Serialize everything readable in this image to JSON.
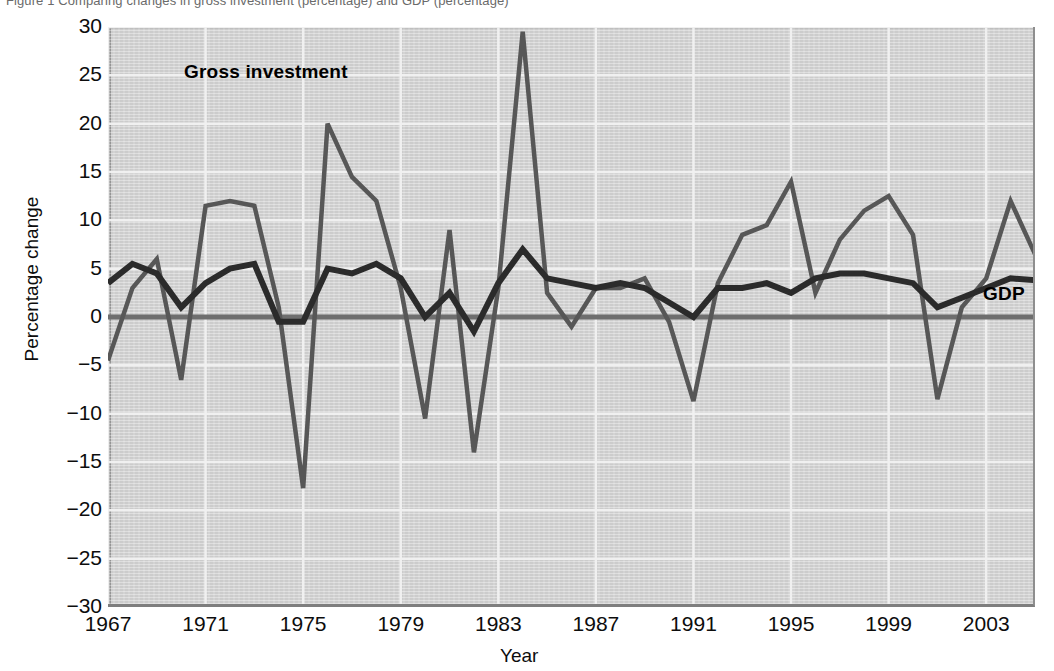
{
  "figure": {
    "caption": "Figure 1   Comparing changes in gross investment (percentage) and GDP (percentage)"
  },
  "annotations": {
    "investment_label": "Gross investment",
    "gdp_label": "GDP"
  },
  "colors": {
    "plot_background": "#d2d2d2",
    "gridline": "#f2f2f2",
    "investment_line": "#575757",
    "gdp_line": "#2b2b2b",
    "zero_line": "#6e6e6e",
    "text": "#0d0d0d"
  },
  "chart_data": {
    "type": "line",
    "title": "",
    "xlabel": "Year",
    "ylabel": "Percentage change",
    "xlim": [
      1967,
      2005
    ],
    "ylim": [
      -30,
      30
    ],
    "yticks": [
      30,
      25,
      20,
      15,
      10,
      5,
      0,
      -5,
      -10,
      -15,
      -20,
      -25,
      -30
    ],
    "ytick_labels": [
      "30",
      "25",
      "20",
      "15",
      "10",
      "5",
      "0",
      "−5",
      "−10",
      "−15",
      "−20",
      "−25",
      "−30"
    ],
    "xticks": [
      1967,
      1971,
      1975,
      1979,
      1983,
      1987,
      1991,
      1995,
      1999,
      2003
    ],
    "xtick_labels": [
      "1967",
      "1971",
      "1975",
      "1979",
      "1983",
      "1987",
      "1991",
      "1995",
      "1999",
      "2003"
    ],
    "grid": true,
    "legend": "in-plot annotations",
    "x": [
      1967,
      1968,
      1969,
      1970,
      1971,
      1972,
      1973,
      1974,
      1975,
      1976,
      1977,
      1978,
      1979,
      1980,
      1981,
      1982,
      1983,
      1984,
      1985,
      1986,
      1987,
      1988,
      1989,
      1990,
      1991,
      1992,
      1993,
      1994,
      1995,
      1996,
      1997,
      1998,
      1999,
      2000,
      2001,
      2002,
      2003,
      2004,
      2005
    ],
    "series": [
      {
        "name": "Gross investment",
        "color": "#575757",
        "values": [
          -4.5,
          3.0,
          6.0,
          -6.5,
          11.5,
          12.0,
          11.5,
          1.0,
          -17.7,
          20.0,
          14.5,
          12.0,
          3.0,
          -10.5,
          9.0,
          -14.0,
          3.0,
          29.5,
          2.5,
          -1.0,
          3.0,
          3.0,
          4.0,
          -0.5,
          -8.7,
          3.5,
          8.5,
          9.5,
          14.0,
          2.5,
          8.0,
          11.0,
          12.5,
          8.5,
          -8.5,
          1.0,
          4.0,
          12.0,
          6.5
        ]
      },
      {
        "name": "GDP",
        "color": "#2b2b2b",
        "values": [
          3.5,
          5.5,
          4.5,
          1.0,
          3.5,
          5.0,
          5.5,
          -0.5,
          -0.5,
          5.0,
          4.5,
          5.5,
          4.0,
          0.0,
          2.5,
          -1.5,
          3.5,
          7.0,
          4.0,
          3.5,
          3.0,
          3.5,
          3.0,
          1.5,
          0.0,
          3.0,
          3.0,
          3.5,
          2.5,
          4.0,
          4.5,
          4.5,
          4.0,
          3.5,
          1.0,
          2.0,
          3.0,
          4.0,
          3.8
        ]
      }
    ]
  }
}
